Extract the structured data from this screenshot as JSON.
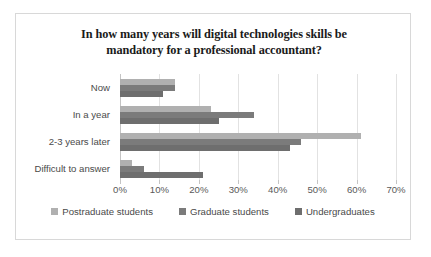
{
  "chart_data": {
    "type": "bar",
    "orientation": "horizontal",
    "title": "In how many years will digital technologies skills be mandatory for a professional accountant?",
    "title_lines": [
      "In how many years will digital technologies skills be",
      "mandatory for a professional accountant?"
    ],
    "xlabel": "",
    "ylabel": "",
    "xlim": [
      0,
      70
    ],
    "xticks": [
      0,
      10,
      20,
      30,
      40,
      50,
      60,
      70
    ],
    "xtick_labels": [
      "0%",
      "10%",
      "20%",
      "30%",
      "40%",
      "50%",
      "60%",
      "70%"
    ],
    "grid": true,
    "legend_position": "bottom",
    "categories": [
      "Now",
      "In a year",
      "2-3 years later",
      "Difficult to answer"
    ],
    "series": [
      {
        "name": "Postraduate students",
        "color": "#b0b0b0",
        "values": [
          14,
          23,
          61,
          3
        ]
      },
      {
        "name": "Graduate students",
        "color": "#7b7b7b",
        "values": [
          14,
          34,
          46,
          6
        ]
      },
      {
        "name": "Undergraduates",
        "color": "#6e6e6e",
        "values": [
          11,
          25,
          43,
          21
        ]
      }
    ]
  },
  "figure": {
    "background": "#ffffff",
    "border_color": "#d8d8d8"
  }
}
